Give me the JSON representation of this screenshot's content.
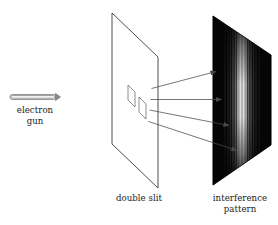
{
  "figure": {
    "background_color": "#ffffff",
    "width": 278,
    "height": 225
  },
  "source": {
    "name": "electron-gun",
    "label_line1": "electron",
    "label_line2": "gun",
    "label_x": 35,
    "label_y1": 113,
    "label_y2": 123,
    "tube": {
      "x": 10,
      "y": 94.5,
      "width": 46,
      "height": 5
    },
    "arrowhead": {
      "x": 56,
      "y": 93.5,
      "width": 4.5,
      "height": 6.5
    },
    "body_color": "#fcfcfc",
    "outline_color": "#7d7d7d"
  },
  "barrier": {
    "name": "double-slit-plate",
    "label": "double slit",
    "label_x": 139,
    "label_y": 201,
    "outline_points": "112,13 158,57 158,188 112,144",
    "fill_color": "#ffffff",
    "stroke_color": "#3a3a3a",
    "slits": [
      {
        "name": "slit-upper",
        "points": "128,85 135,92 135,107 128,100"
      },
      {
        "name": "slit-lower",
        "points": "139,97 146,104 146,119 139,112"
      }
    ],
    "slit_stroke_color": "#6a6a6a"
  },
  "beams": {
    "name": "electron-beams",
    "color": "#4a4a4a",
    "arrows": [
      {
        "name": "beam-arrow-1",
        "x1": 151.5,
        "y1": 88.5,
        "x2": 216.0,
        "y2": 71.5
      },
      {
        "name": "beam-arrow-2",
        "x1": 150.5,
        "y1": 99.5,
        "x2": 221.5,
        "y2": 99.5
      },
      {
        "name": "beam-arrow-3",
        "x1": 149.5,
        "y1": 110.0,
        "x2": 229.0,
        "y2": 125.5
      },
      {
        "name": "beam-arrow-4",
        "x1": 148.5,
        "y1": 121.5,
        "x2": 237.0,
        "y2": 150.5
      }
    ]
  },
  "screen": {
    "name": "interference-screen",
    "label_line1": "interference",
    "label_line2": "pattern",
    "label_x": 240,
    "label_y1": 201,
    "label_y2": 212,
    "outline_points": "213,16 271,55 271,145 213,185",
    "base_color": "#050505",
    "fringe_color": "#e8e8e8",
    "fringe_center_x": 242,
    "fringes": [
      {
        "offset": -17,
        "width": 1.1,
        "brightness": 0.12
      },
      {
        "offset": -14,
        "width": 1.3,
        "brightness": 0.18
      },
      {
        "offset": -11.5,
        "width": 1.5,
        "brightness": 0.26
      },
      {
        "offset": -9,
        "width": 1.7,
        "brightness": 0.38
      },
      {
        "offset": -6.5,
        "width": 1.9,
        "brightness": 0.52
      },
      {
        "offset": -4,
        "width": 2.2,
        "brightness": 0.72
      },
      {
        "offset": -1.5,
        "width": 2.6,
        "brightness": 0.92
      },
      {
        "offset": 1.5,
        "width": 2.6,
        "brightness": 0.92
      },
      {
        "offset": 4,
        "width": 2.2,
        "brightness": 0.72
      },
      {
        "offset": 6.5,
        "width": 1.9,
        "brightness": 0.52
      },
      {
        "offset": 9,
        "width": 1.7,
        "brightness": 0.38
      },
      {
        "offset": 11.5,
        "width": 1.5,
        "brightness": 0.26
      },
      {
        "offset": 14,
        "width": 1.3,
        "brightness": 0.18
      },
      {
        "offset": 17,
        "width": 1.1,
        "brightness": 0.12
      }
    ]
  }
}
